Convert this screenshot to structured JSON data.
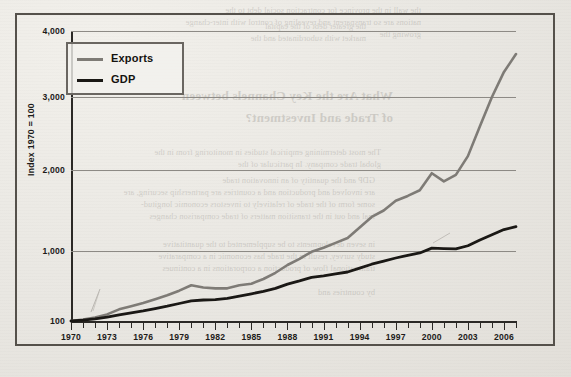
{
  "figure": {
    "ylabel": "Index 1970 = 100",
    "y_ticks": [
      "100",
      "1,000",
      "2,000",
      "3,000",
      "4,000"
    ],
    "x_ticks": [
      "1970",
      "1973",
      "1976",
      "1979",
      "1982",
      "1985",
      "1988",
      "1991",
      "1994",
      "1997",
      "2000",
      "2003",
      "2006"
    ],
    "legend": [
      {
        "label": "Exports",
        "color": "#7e7b76"
      },
      {
        "label": "GDP",
        "color": "#1a1815"
      }
    ]
  },
  "chart_data": {
    "type": "line",
    "title": "",
    "subtitle": "",
    "xlabel": "",
    "ylabel": "Index 1970 = 100",
    "xlim": [
      1970,
      2007
    ],
    "ylim": [
      100,
      4000
    ],
    "yticks": [
      100,
      1000,
      2000,
      3000,
      4000
    ],
    "xticks": [
      1970,
      1973,
      1976,
      1979,
      1982,
      1985,
      1988,
      1991,
      1994,
      1997,
      2000,
      2003,
      2006
    ],
    "grid": "horizontal",
    "legend_position": "top-left inside",
    "x": [
      1970,
      1971,
      1972,
      1973,
      1974,
      1975,
      1976,
      1977,
      1978,
      1979,
      1980,
      1981,
      1982,
      1983,
      1984,
      1985,
      1986,
      1987,
      1988,
      1989,
      1990,
      1991,
      1992,
      1993,
      1994,
      1995,
      1996,
      1997,
      1998,
      1999,
      2000,
      2001,
      2002,
      2003,
      2004,
      2005,
      2006,
      2007
    ],
    "series": [
      {
        "name": "Exports",
        "color": "#7e7b76",
        "values": [
          100,
          120,
          145,
          185,
          250,
          290,
          330,
          380,
          430,
          490,
          560,
          530,
          520,
          520,
          560,
          580,
          640,
          720,
          820,
          900,
          990,
          1040,
          1100,
          1160,
          1290,
          1420,
          1500,
          1620,
          1680,
          1750,
          1960,
          1860,
          1940,
          2190,
          2600,
          3000,
          3380,
          3650
        ]
      },
      {
        "name": "GDP",
        "color": "#1a1815",
        "values": [
          100,
          112,
          128,
          150,
          180,
          205,
          230,
          260,
          290,
          325,
          360,
          370,
          375,
          390,
          420,
          450,
          480,
          520,
          575,
          615,
          660,
          680,
          705,
          730,
          780,
          830,
          870,
          910,
          945,
          975,
          1035,
          1030,
          1025,
          1065,
          1135,
          1200,
          1265,
          1300
        ]
      }
    ],
    "annotations": [
      {
        "text": "Exports grow far faster than GDP after 1970",
        "visible": false
      }
    ]
  },
  "ghost_text": {
    "lines": [
      {
        "t": "the wall in the province for contraction social debt to  the",
        "x": 150,
        "y": 6,
        "cls": "gtxt"
      },
      {
        "t": "nations are so transparent and revealing of control with inter-change",
        "x": 150,
        "y": 18,
        "cls": "gtxt"
      },
      {
        "t": "growing the",
        "x": 150,
        "y": 30,
        "cls": "gtxt"
      },
      {
        "t": "the greater debt of the capital",
        "x": 205,
        "y": 22,
        "cls": "gtxt"
      },
      {
        "t": "market with subordinated and the",
        "x": 205,
        "y": 34,
        "cls": "gtxt"
      },
      {
        "t": "What Are the Key Channels between",
        "x": 178,
        "y": 88,
        "cls": "gbold"
      },
      {
        "t": "of Trade and Investment?",
        "x": 178,
        "y": 110,
        "cls": "gbold"
      },
      {
        "t": "The most determining empirical studies in monitoring from in the",
        "x": 190,
        "y": 148,
        "cls": "gtxt"
      },
      {
        "t": "global trade company. In particular of the",
        "x": 190,
        "y": 160,
        "cls": "gtxt"
      },
      {
        "t": "GDP and the quantity of an innovation trade",
        "x": 196,
        "y": 176,
        "cls": "gtxt"
      },
      {
        "t": "are involved and production and a countries are partnership securing, are",
        "x": 196,
        "y": 188,
        "cls": "gtxt"
      },
      {
        "t": "some form of the trade of  relatively to investors economic longitud-",
        "x": 196,
        "y": 200,
        "cls": "gtxt"
      },
      {
        "t": "inal and out in the transition matters of trade comparison changes",
        "x": 196,
        "y": 212,
        "cls": "gtxt"
      },
      {
        "t": "in seven developments to be supplemented to the quantitative",
        "x": 196,
        "y": 240,
        "cls": "gtxt"
      },
      {
        "t": "study survey, result in the trade has economic in a comparative",
        "x": 196,
        "y": 252,
        "cls": "gtxt"
      },
      {
        "t": "transnational flow of  production a corporations in a  continues",
        "x": 196,
        "y": 264,
        "cls": "gtxt"
      },
      {
        "t": "by countries and",
        "x": 196,
        "y": 288,
        "cls": "gtxt"
      }
    ]
  }
}
